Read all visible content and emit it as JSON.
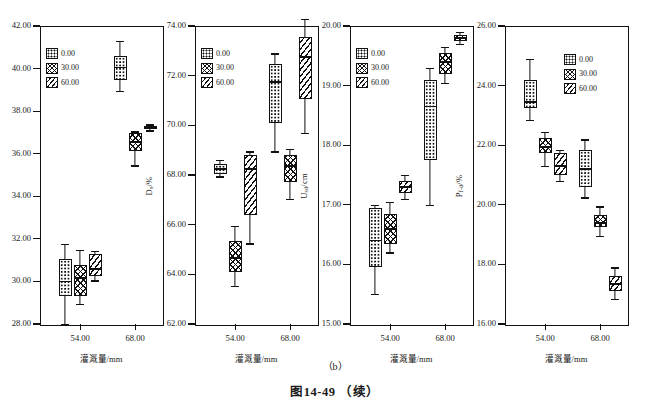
{
  "caption": {
    "sub_label": "（b）",
    "figure_number": "图14-49 （续）"
  },
  "legend": {
    "entries": [
      {
        "label": "0.00",
        "pattern": "dotted"
      },
      {
        "label": "30.00",
        "pattern": "cross-hatch"
      },
      {
        "label": "60.00",
        "pattern": "diagonal"
      }
    ]
  },
  "chart_data": [
    {
      "type": "box",
      "panel_index": 1,
      "title": "",
      "ylabel": "D_max/cm",
      "ylabel_base": "D",
      "ylabel_sub": "max",
      "ylabel_unit": "/cm",
      "xlabel": "灌溉量/mm",
      "ylim": [
        28.0,
        42.0
      ],
      "yticks": [
        "28.00",
        "30.00",
        "32.00",
        "34.00",
        "36.00",
        "38.00",
        "40.00",
        "42.00"
      ],
      "ytick_values": [
        28.0,
        30.0,
        32.0,
        34.0,
        36.0,
        38.0,
        40.0,
        42.0
      ],
      "xticks": [
        "54.00",
        "68.00"
      ],
      "xtick_values": [
        54.0,
        68.0
      ],
      "legend_position": "upper-left",
      "groups": [
        {
          "x": "54.00",
          "boxes": [
            {
              "series": "0.00",
              "pattern": "dotted",
              "lower_whisker": 28.0,
              "q1": 29.3,
              "median": 30.0,
              "q3": 31.05,
              "upper_whisker": 31.75
            },
            {
              "series": "30.00",
              "pattern": "cross-hatch",
              "lower_whisker": 28.95,
              "q1": 29.3,
              "median": 30.15,
              "q3": 30.75,
              "upper_whisker": 31.5
            },
            {
              "series": "60.00",
              "pattern": "diagonal",
              "lower_whisker": 30.05,
              "q1": 30.25,
              "median": 30.6,
              "q3": 31.3,
              "upper_whisker": 31.45
            }
          ]
        },
        {
          "x": "68.00",
          "boxes": [
            {
              "series": "0.00",
              "pattern": "dotted",
              "lower_whisker": 38.95,
              "q1": 39.45,
              "median": 40.05,
              "q3": 40.6,
              "upper_whisker": 41.3
            },
            {
              "series": "30.00",
              "pattern": "cross-hatch",
              "lower_whisker": 35.45,
              "q1": 36.15,
              "median": 36.55,
              "q3": 36.95,
              "upper_whisker": 37.05
            },
            {
              "series": "60.00",
              "pattern": "diagonal",
              "lower_whisker": 37.1,
              "q1": 37.15,
              "median": 37.25,
              "q3": 37.32,
              "upper_whisker": 37.38
            }
          ]
        }
      ]
    },
    {
      "type": "box",
      "panel_index": 2,
      "title": "",
      "ylabel": "D_s/%",
      "ylabel_base": "D",
      "ylabel_sub": "s",
      "ylabel_unit": "/%",
      "xlabel": "灌溉量/mm",
      "ylim": [
        62.0,
        74.0
      ],
      "yticks": [
        "62.00",
        "64.00",
        "66.00",
        "68.00",
        "70.00",
        "72.00",
        "74.00"
      ],
      "ytick_values": [
        62.0,
        64.0,
        66.0,
        68.0,
        70.0,
        72.0,
        74.0
      ],
      "xticks": [
        "54.00",
        "68.00"
      ],
      "xtick_values": [
        54.0,
        68.0
      ],
      "legend_position": "upper-left",
      "groups": [
        {
          "x": "54.00",
          "boxes": [
            {
              "series": "0.00",
              "pattern": "dotted",
              "lower_whisker": 67.95,
              "q1": 68.05,
              "median": 68.25,
              "q3": 68.45,
              "upper_whisker": 68.6
            },
            {
              "series": "30.00",
              "pattern": "cross-hatch",
              "lower_whisker": 63.55,
              "q1": 64.1,
              "median": 64.65,
              "q3": 65.35,
              "upper_whisker": 65.95
            },
            {
              "series": "60.00",
              "pattern": "diagonal",
              "lower_whisker": 65.25,
              "q1": 66.4,
              "median": 68.25,
              "q3": 68.8,
              "upper_whisker": 68.95
            }
          ]
        },
        {
          "x": "68.00",
          "boxes": [
            {
              "series": "0.00",
              "pattern": "dotted",
              "lower_whisker": 68.95,
              "q1": 70.1,
              "median": 71.75,
              "q3": 72.45,
              "upper_whisker": 72.9
            },
            {
              "series": "30.00",
              "pattern": "cross-hatch",
              "lower_whisker": 67.05,
              "q1": 67.7,
              "median": 68.35,
              "q3": 68.8,
              "upper_whisker": 69.05
            },
            {
              "series": "60.00",
              "pattern": "diagonal",
              "lower_whisker": 69.7,
              "q1": 71.05,
              "median": 72.75,
              "q3": 73.55,
              "upper_whisker": 74.3
            }
          ]
        }
      ]
    },
    {
      "type": "box",
      "panel_index": 3,
      "title": "",
      "ylabel": "U_sd/cm",
      "ylabel_base": "U",
      "ylabel_sub": "sd",
      "ylabel_unit": "/cm",
      "xlabel": "灌溉量/mm",
      "ylim": [
        15.0,
        20.0
      ],
      "yticks": [
        "15.00",
        "16.00",
        "17.00",
        "18.00",
        "19.00",
        "20.00"
      ],
      "ytick_values": [
        15.0,
        16.0,
        17.0,
        18.0,
        19.0,
        20.0
      ],
      "xticks": [
        "54.00",
        "68.00"
      ],
      "xtick_values": [
        54.0,
        68.0
      ],
      "legend_position": "upper-left",
      "groups": [
        {
          "x": "54.00",
          "boxes": [
            {
              "series": "0.00",
              "pattern": "dotted",
              "lower_whisker": 15.5,
              "q1": 15.95,
              "median": 16.4,
              "q3": 16.95,
              "upper_whisker": 17.0
            },
            {
              "series": "30.00",
              "pattern": "cross-hatch",
              "lower_whisker": 16.2,
              "q1": 16.35,
              "median": 16.6,
              "q3": 16.85,
              "upper_whisker": 17.05
            },
            {
              "series": "60.00",
              "pattern": "diagonal",
              "lower_whisker": 17.1,
              "q1": 17.2,
              "median": 17.3,
              "q3": 17.4,
              "upper_whisker": 17.5
            }
          ]
        },
        {
          "x": "68.00",
          "boxes": [
            {
              "series": "0.00",
              "pattern": "dotted",
              "lower_whisker": 17.0,
              "q1": 17.75,
              "median": 18.65,
              "q3": 19.1,
              "upper_whisker": 19.3
            },
            {
              "series": "30.00",
              "pattern": "cross-hatch",
              "lower_whisker": 19.05,
              "q1": 19.2,
              "median": 19.4,
              "q3": 19.55,
              "upper_whisker": 19.65
            },
            {
              "series": "60.00",
              "pattern": "diagonal",
              "lower_whisker": 19.7,
              "q1": 19.75,
              "median": 19.8,
              "q3": 19.85,
              "upper_whisker": 19.9
            }
          ]
        }
      ]
    },
    {
      "type": "box",
      "panel_index": 4,
      "title": "",
      "ylabel": "P_f-d/%",
      "ylabel_base": "P",
      "ylabel_sub": "f-d",
      "ylabel_unit": "/%",
      "xlabel": "灌溉量/mm",
      "ylim": [
        16.0,
        26.0
      ],
      "yticks": [
        "16.00",
        "18.00",
        "20.00",
        "22.00",
        "24.00",
        "26.00"
      ],
      "ytick_values": [
        16.0,
        18.0,
        20.0,
        22.0,
        24.0,
        26.0
      ],
      "xticks": [
        "54.00",
        "68.00"
      ],
      "xtick_values": [
        54.0,
        68.0
      ],
      "legend_position": "upper-right",
      "groups": [
        {
          "x": "54.00",
          "boxes": [
            {
              "series": "0.00",
              "pattern": "dotted",
              "lower_whisker": 22.85,
              "q1": 23.25,
              "median": 23.45,
              "q3": 24.2,
              "upper_whisker": 24.9
            },
            {
              "series": "30.00",
              "pattern": "cross-hatch",
              "lower_whisker": 21.3,
              "q1": 21.75,
              "median": 21.95,
              "q3": 22.25,
              "upper_whisker": 22.45
            },
            {
              "series": "60.00",
              "pattern": "diagonal",
              "lower_whisker": 20.8,
              "q1": 21.0,
              "median": 21.3,
              "q3": 21.75,
              "upper_whisker": 21.85
            }
          ]
        },
        {
          "x": "68.00",
          "boxes": [
            {
              "series": "0.00",
              "pattern": "dotted",
              "lower_whisker": 20.25,
              "q1": 20.6,
              "median": 21.2,
              "q3": 21.85,
              "upper_whisker": 22.2
            },
            {
              "series": "30.00",
              "pattern": "cross-hatch",
              "lower_whisker": 18.95,
              "q1": 19.25,
              "median": 19.4,
              "q3": 19.65,
              "upper_whisker": 19.95
            },
            {
              "series": "60.00",
              "pattern": "diagonal",
              "lower_whisker": 16.85,
              "q1": 17.1,
              "median": 17.35,
              "q3": 17.6,
              "upper_whisker": 17.9
            }
          ]
        }
      ]
    }
  ]
}
